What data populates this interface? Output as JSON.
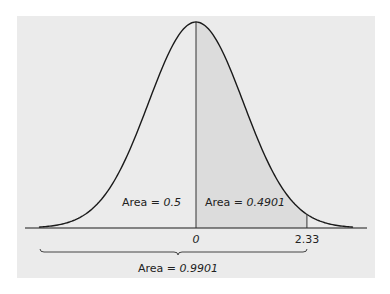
{
  "chart_data": {
    "type": "area",
    "title": "",
    "distribution": "standard normal",
    "xlabel": "",
    "ylabel": "",
    "x_ticks": [
      "0",
      "2.33"
    ],
    "x_tick_values": [
      0,
      2.33
    ],
    "grid": false,
    "legend": null,
    "regions": [
      {
        "name": "left half",
        "from": "-inf",
        "to": 0,
        "area": 0.5,
        "label": "Area = 0.5"
      },
      {
        "name": "shaded",
        "from": 0,
        "to": 2.33,
        "area": 0.4901,
        "label": "Area = 0.4901"
      }
    ],
    "brace": {
      "from": "-inf",
      "to": 2.33,
      "area": 0.9901,
      "label": "Area = 0.9901"
    }
  },
  "labels": {
    "left_area": {
      "prefix": "Area = ",
      "value": "0.5"
    },
    "right_area": {
      "prefix": "Area = ",
      "value": "0.4901"
    },
    "total_area": {
      "prefix": "Area = ",
      "value": "0.9901"
    },
    "tick_zero": "0",
    "tick_z": "2.33"
  },
  "colors": {
    "background": "#ffffff",
    "panel": "#ebebeb",
    "shaded_region": "#dcdcdc",
    "curve": "#1a1a1a"
  }
}
